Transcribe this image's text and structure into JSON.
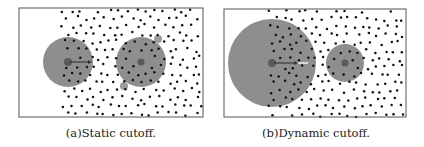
{
  "figure": {
    "colors": {
      "frame": "#555555",
      "dot": "#111111",
      "cutoff_circle": "#8e8e8e",
      "small_particle": "#9a9a9a",
      "center_particle": "#5a5a5a",
      "arrow": "#333333",
      "arrow_tip_faded": "#d8d8d8"
    },
    "panels": [
      {
        "id": "a",
        "caption": "(a)Static cutoff.",
        "caption_x": 111,
        "caption_y": 126,
        "frame": {
          "x": 19,
          "y": 8,
          "w": 184,
          "h": 109
        },
        "dots": {
          "x_start": 63,
          "x_end": 202,
          "y_start": 10,
          "y_end": 116,
          "spacing": 9.2,
          "seed": 7
        },
        "cutoff_circles": [
          {
            "cx": 68,
            "cy": 62,
            "r": 25
          },
          {
            "cx": 141,
            "cy": 62,
            "r": 25
          }
        ],
        "small_particles": [
          {
            "cx": 158,
            "cy": 39,
            "r": 4
          },
          {
            "cx": 124,
            "cy": 86,
            "r": 4
          }
        ],
        "center_particles": [
          {
            "cx": 68,
            "cy": 62,
            "r": 4
          },
          {
            "cx": 141,
            "cy": 62,
            "r": 3.5
          }
        ],
        "arrow": {
          "x1": 70,
          "y1": 62,
          "x2": 92,
          "y2": 62,
          "tip_extra": 0
        }
      },
      {
        "id": "b",
        "caption": "(b)Dynamic cutoff.",
        "caption_x": 316,
        "caption_y": 126,
        "frame": {
          "x": 224,
          "y": 9,
          "w": 182,
          "h": 108
        },
        "dots": {
          "x_start": 270,
          "x_end": 405,
          "y_start": 11,
          "y_end": 116,
          "spacing": 9.2,
          "seed": 13
        },
        "cutoff_circles": [
          {
            "cx": 272,
            "cy": 63,
            "r": 44
          },
          {
            "cx": 345,
            "cy": 63,
            "r": 19
          }
        ],
        "small_particles": [],
        "center_particles": [
          {
            "cx": 272,
            "cy": 63,
            "r": 4
          },
          {
            "cx": 345,
            "cy": 63,
            "r": 3.5
          }
        ],
        "arrow": {
          "x1": 274,
          "y1": 63,
          "x2": 298,
          "y2": 63,
          "tip_extra": 10
        }
      }
    ]
  }
}
